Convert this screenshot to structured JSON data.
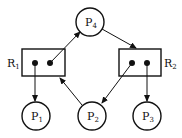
{
  "diagram": {
    "type": "resource-allocation-graph",
    "processes": [
      {
        "id": "P1",
        "label": "P",
        "sub": "1",
        "cx": 36,
        "cy": 116
      },
      {
        "id": "P2",
        "label": "P",
        "sub": "2",
        "cx": 92,
        "cy": 116
      },
      {
        "id": "P3",
        "label": "P",
        "sub": "3",
        "cx": 147,
        "cy": 116
      },
      {
        "id": "P4",
        "label": "P",
        "sub": "4",
        "cx": 90,
        "cy": 22
      }
    ],
    "resources": [
      {
        "id": "R1",
        "label": "R",
        "sub": "1",
        "instances": 2
      },
      {
        "id": "R2",
        "label": "R",
        "sub": "2",
        "instances": 2
      }
    ],
    "edges": [
      {
        "from": "R1",
        "to": "P4",
        "kind": "assignment"
      },
      {
        "from": "P4",
        "to": "R2",
        "kind": "request"
      },
      {
        "from": "R1",
        "to": "P1",
        "kind": "assignment"
      },
      {
        "from": "P2",
        "to": "R1",
        "kind": "request"
      },
      {
        "from": "R2",
        "to": "P2",
        "kind": "assignment"
      },
      {
        "from": "R2",
        "to": "P3",
        "kind": "assignment"
      }
    ]
  },
  "labels": {
    "p1": "P",
    "p1_sub": "1",
    "p2": "P",
    "p2_sub": "2",
    "p3": "P",
    "p3_sub": "3",
    "p4": "P",
    "p4_sub": "4",
    "r1": "R",
    "r1_sub": "1",
    "r2": "R",
    "r2_sub": "2"
  }
}
